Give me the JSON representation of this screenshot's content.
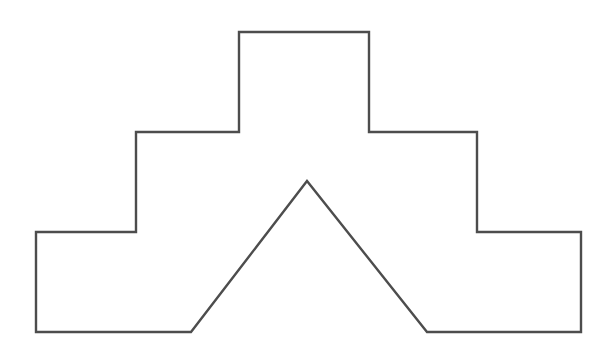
{
  "canvas": {
    "width": 612,
    "height": 354,
    "background_color": "#ffffff",
    "title": "Stepped pyramid outline with V-notch"
  },
  "figure": {
    "name": "stepped-polygon-with-notch",
    "type": "line-drawing",
    "stroke_color": "#4d4d4d",
    "fill_color": "#ffffff",
    "stroke_width": 2.4,
    "closed": true,
    "vertex_count": 15,
    "symmetry_axis_x": 308.5,
    "vertices": [
      [
        239,
        32
      ],
      [
        369,
        32
      ],
      [
        369,
        132
      ],
      [
        477,
        132
      ],
      [
        477,
        232
      ],
      [
        581,
        232
      ],
      [
        581,
        332
      ],
      [
        427,
        332
      ],
      [
        307,
        181
      ],
      [
        191,
        332
      ],
      [
        36,
        332
      ],
      [
        36,
        232
      ],
      [
        136,
        232
      ],
      [
        136,
        132
      ],
      [
        239,
        132
      ]
    ],
    "points_attr": "239,32 369,32 369,132 477,132 477,232 581,232 581,332 427,332 307,181 191,332 36,332 36,232 136,232 136,132 239,132",
    "levels": [
      {
        "name": "top-tier",
        "left_x": 239,
        "right_x": 369,
        "top_y": 32,
        "bottom_y": 132,
        "width": 130,
        "height": 100
      },
      {
        "name": "middle-tier",
        "left_x": 136,
        "right_x": 477,
        "top_y": 132,
        "bottom_y": 232,
        "width": 341,
        "height": 100
      },
      {
        "name": "bottom-tier",
        "left_x": 36,
        "right_x": 581,
        "top_y": 232,
        "bottom_y": 332,
        "width": 545,
        "height": 100
      }
    ],
    "notch": {
      "name": "v-notch",
      "apex": [
        307,
        181
      ],
      "left_base": [
        191,
        332
      ],
      "right_base": [
        427,
        332
      ],
      "base_width": 236,
      "height": 151
    }
  }
}
